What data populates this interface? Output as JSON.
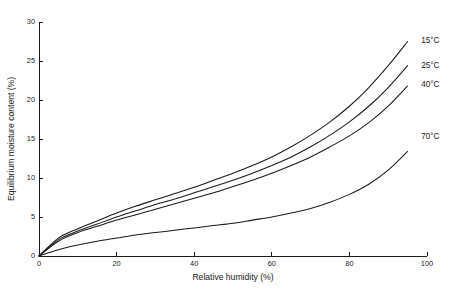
{
  "chart_data": {
    "type": "line",
    "title": "",
    "xlabel": "Relative humidity (%)",
    "ylabel": "Equilibrium moisture content (%)",
    "xlim": [
      0,
      100
    ],
    "ylim": [
      0,
      30
    ],
    "xticks": [
      0,
      20,
      40,
      60,
      80,
      100
    ],
    "yticks": [
      0,
      5,
      10,
      15,
      20,
      25,
      30
    ],
    "xtick_labels": [
      "0",
      "20",
      "40",
      "60",
      "80",
      "100"
    ],
    "ytick_labels": [
      "0",
      "5",
      "10",
      "15",
      "20",
      "25",
      "30"
    ],
    "grid": false,
    "legend_position": "inline-right-of-curve-ends",
    "x": [
      0,
      5,
      10,
      15,
      20,
      25,
      30,
      35,
      40,
      45,
      50,
      55,
      60,
      65,
      70,
      75,
      80,
      85,
      90,
      95
    ],
    "series": [
      {
        "name": "15°C",
        "label": "15°C",
        "color": "#1a1a1a",
        "values": [
          0,
          2.3,
          3.5,
          4.5,
          5.5,
          6.4,
          7.2,
          8.0,
          8.8,
          9.7,
          10.6,
          11.6,
          12.7,
          14.0,
          15.5,
          17.2,
          19.2,
          21.6,
          24.4,
          27.5
        ]
      },
      {
        "name": "25°C",
        "label": "25°C",
        "color": "#1a1a1a",
        "values": [
          0,
          2.1,
          3.2,
          4.1,
          5.0,
          5.8,
          6.6,
          7.3,
          8.1,
          8.9,
          9.7,
          10.6,
          11.6,
          12.7,
          14.0,
          15.5,
          17.2,
          19.2,
          21.6,
          24.4
        ]
      },
      {
        "name": "40°C",
        "label": "40°C",
        "color": "#1a1a1a",
        "values": [
          0,
          1.9,
          3.0,
          3.8,
          4.6,
          5.3,
          6.0,
          6.7,
          7.4,
          8.1,
          8.9,
          9.7,
          10.6,
          11.6,
          12.7,
          14.0,
          15.4,
          17.1,
          19.2,
          21.8
        ]
      },
      {
        "name": "70°C",
        "label": "70°C",
        "color": "#1a1a1a",
        "values": [
          0,
          0.8,
          1.4,
          1.9,
          2.3,
          2.7,
          3.0,
          3.3,
          3.6,
          3.9,
          4.2,
          4.6,
          5.0,
          5.5,
          6.1,
          6.9,
          7.9,
          9.2,
          11.0,
          13.4
        ]
      }
    ],
    "series_label_positions": [
      {
        "label": "15°C",
        "x": 98.5,
        "y": 27.6
      },
      {
        "label": "25°C",
        "x": 98.5,
        "y": 24.4
      },
      {
        "label": "40°C",
        "x": 98.5,
        "y": 21.9
      },
      {
        "label": "70°C",
        "x": 98.5,
        "y": 15.3
      }
    ]
  }
}
